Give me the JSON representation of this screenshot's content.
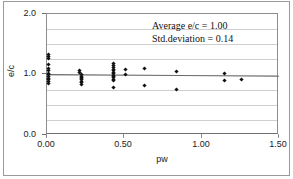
{
  "chart_data": {
    "type": "scatter",
    "title": "",
    "xlabel": "pw",
    "ylabel": "e/c",
    "xlim": [
      0.0,
      1.5
    ],
    "ylim": [
      0.0,
      2.0
    ],
    "xticks": [
      "0.00",
      "0.50",
      "1.00",
      "1.50"
    ],
    "xtick_values": [
      0.0,
      0.5,
      1.0,
      1.5
    ],
    "yticks": [
      "0.0",
      "1.0",
      "2.0"
    ],
    "ytick_values": [
      0.0,
      1.0,
      2.0
    ],
    "grid": "horizontal gridlines every 0.25",
    "gridline_values": [
      0.25,
      0.5,
      0.75,
      1.0,
      1.25,
      1.5,
      1.75
    ],
    "legend": "none",
    "marker": "filled diamond",
    "marker_color": "#111111",
    "series": [
      {
        "name": "e/c vs pw",
        "points": [
          [
            0.01,
            1.33
          ],
          [
            0.01,
            1.3
          ],
          [
            0.01,
            1.26
          ],
          [
            0.01,
            1.16
          ],
          [
            0.01,
            1.1
          ],
          [
            0.01,
            1.06
          ],
          [
            0.01,
            1.02
          ],
          [
            0.01,
            1.0
          ],
          [
            0.01,
            0.97
          ],
          [
            0.01,
            0.94
          ],
          [
            0.01,
            0.91
          ],
          [
            0.01,
            0.88
          ],
          [
            0.01,
            0.85
          ],
          [
            0.21,
            1.07
          ],
          [
            0.21,
            1.04
          ],
          [
            0.22,
            1.0
          ],
          [
            0.22,
            0.97
          ],
          [
            0.22,
            0.95
          ],
          [
            0.22,
            0.93
          ],
          [
            0.22,
            0.91
          ],
          [
            0.22,
            0.88
          ],
          [
            0.22,
            0.86
          ],
          [
            0.22,
            0.83
          ],
          [
            0.43,
            1.18
          ],
          [
            0.43,
            1.15
          ],
          [
            0.43,
            1.12
          ],
          [
            0.43,
            1.09
          ],
          [
            0.43,
            1.06
          ],
          [
            0.43,
            1.03
          ],
          [
            0.43,
            1.01
          ],
          [
            0.43,
            0.99
          ],
          [
            0.43,
            0.97
          ],
          [
            0.43,
            0.95
          ],
          [
            0.43,
            0.92
          ],
          [
            0.43,
            0.9
          ],
          [
            0.43,
            0.78
          ],
          [
            0.51,
            1.09
          ],
          [
            0.51,
            1.0
          ],
          [
            0.63,
            1.1
          ],
          [
            0.63,
            0.82
          ],
          [
            0.84,
            1.05
          ],
          [
            0.84,
            0.75
          ],
          [
            1.15,
            1.02
          ],
          [
            1.15,
            0.9
          ],
          [
            1.26,
            0.92
          ]
        ]
      }
    ],
    "trendline": {
      "present": true,
      "y_at_xmin": 1.005,
      "y_at_xmax": 0.975
    },
    "annotations": {
      "average_label": "Average e/c = 1.00",
      "std_label": "Std.deviation = 0.14",
      "average_value": 1.0,
      "std_value": 0.14
    }
  }
}
